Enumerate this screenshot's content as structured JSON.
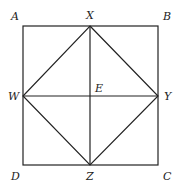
{
  "diagram": {
    "type": "geometry",
    "colors": {
      "stroke": "#222222",
      "background": "#ffffff"
    },
    "points": {
      "A": {
        "label": "A",
        "x": 23,
        "y": 26
      },
      "B": {
        "label": "B",
        "x": 158,
        "y": 26
      },
      "C": {
        "label": "C",
        "x": 158,
        "y": 165
      },
      "D": {
        "label": "D",
        "x": 23,
        "y": 165
      },
      "X": {
        "label": "X",
        "x": 90,
        "y": 26
      },
      "Y": {
        "label": "Y",
        "x": 158,
        "y": 96
      },
      "Z": {
        "label": "Z",
        "x": 90,
        "y": 165
      },
      "W": {
        "label": "W",
        "x": 23,
        "y": 96
      },
      "E": {
        "label": "E",
        "x": 90,
        "y": 96
      }
    },
    "segments": [
      "AB",
      "BC",
      "CD",
      "DA",
      "XY",
      "YZ",
      "ZW",
      "WX",
      "XZ",
      "WY"
    ]
  }
}
